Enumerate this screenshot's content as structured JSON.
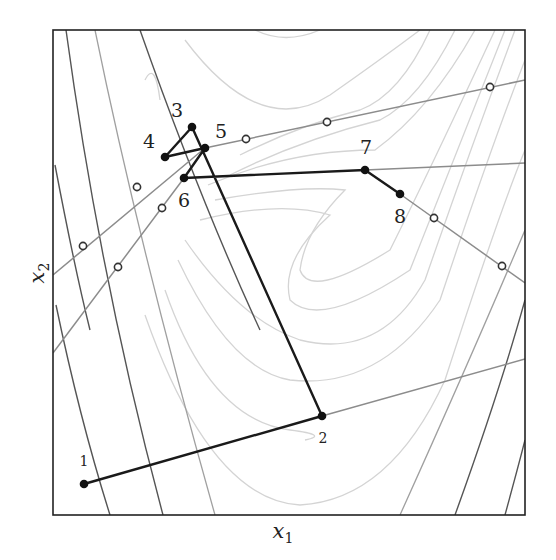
{
  "figure": {
    "type": "optimization-path-over-contours",
    "xlabel": "x",
    "xlabel_sub": "1",
    "ylabel": "x",
    "ylabel_sub": "2",
    "frame": {
      "x": 53,
      "y": 30,
      "width": 472,
      "height": 485
    }
  },
  "points": [
    {
      "label": "1",
      "x": 84,
      "y": 484,
      "lx": 84,
      "ly": 466
    },
    {
      "label": "2",
      "x": 322,
      "y": 416,
      "lx": 323,
      "ly": 443
    },
    {
      "label": "3",
      "x": 192,
      "y": 127,
      "lx": 177,
      "ly": 117
    },
    {
      "label": "4",
      "x": 165,
      "y": 157,
      "lx": 149,
      "ly": 148
    },
    {
      "label": "5",
      "x": 205,
      "y": 148,
      "lx": 221,
      "ly": 138
    },
    {
      "label": "6",
      "x": 184,
      "y": 178,
      "lx": 184,
      "ly": 207
    },
    {
      "label": "7",
      "x": 365,
      "y": 170,
      "lx": 366,
      "ly": 154
    },
    {
      "label": "8",
      "x": 400,
      "y": 194,
      "lx": 400,
      "ly": 223
    }
  ],
  "search_lines": [
    {
      "x1": 53,
      "y1": 275,
      "x2": 205,
      "y2": 148
    },
    {
      "x1": 53,
      "y1": 353,
      "x2": 184,
      "y2": 178
    },
    {
      "x1": 205,
      "y1": 148,
      "x2": 525,
      "y2": 80
    },
    {
      "x1": 365,
      "y1": 170,
      "x2": 525,
      "y2": 163
    },
    {
      "x1": 400,
      "y1": 194,
      "x2": 525,
      "y2": 283
    },
    {
      "x1": 322,
      "y1": 416,
      "x2": 525,
      "y2": 359
    }
  ],
  "sample_points": [
    {
      "x": 137,
      "y": 187
    },
    {
      "x": 83,
      "y": 246
    },
    {
      "x": 162,
      "y": 208
    },
    {
      "x": 118,
      "y": 267
    },
    {
      "x": 246,
      "y": 139
    },
    {
      "x": 327,
      "y": 122
    },
    {
      "x": 490,
      "y": 87
    },
    {
      "x": 434,
      "y": 218
    },
    {
      "x": 502,
      "y": 266
    }
  ],
  "colors": {
    "path": "#1a1a1a",
    "search_line": "#8c8c8c",
    "contour_light": "#d2d2d2",
    "contour_mid": "#9a9a9a",
    "contour_dark": "#4a4a4a",
    "frame": "#222222"
  }
}
